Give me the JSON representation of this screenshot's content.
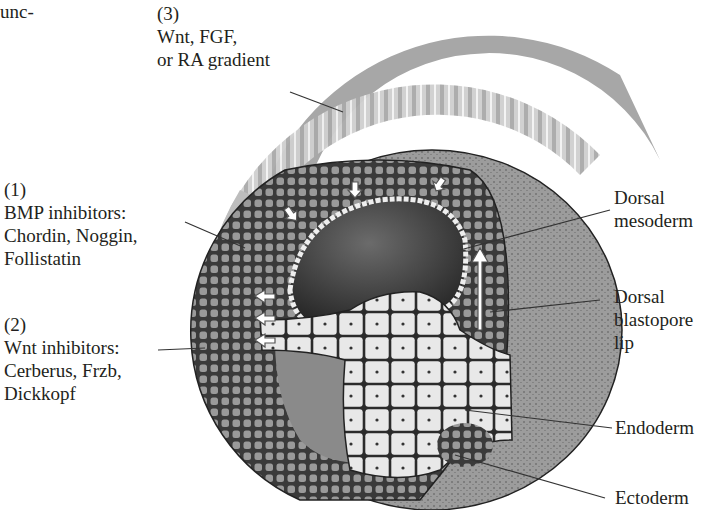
{
  "figure": {
    "partial_text_top_left": "unc-",
    "signals": [
      {
        "number": "(3)",
        "lines": [
          "Wnt, FGF,",
          "or RA gradient"
        ]
      },
      {
        "number": "(1)",
        "lines": [
          "BMP inhibitors:",
          "Chordin, Noggin,",
          "Follistatin"
        ]
      },
      {
        "number": "(2)",
        "lines": [
          "Wnt inhibitors:",
          "Cerberus, Frzb,",
          "Dickkopf"
        ]
      }
    ],
    "structures": [
      {
        "lines": [
          "Dorsal",
          "mesoderm"
        ]
      },
      {
        "lines": [
          "Dorsal",
          "blastopore",
          "lip"
        ]
      },
      {
        "lines": [
          "Endoderm"
        ]
      },
      {
        "lines": [
          "Ectoderm"
        ]
      }
    ],
    "colors": {
      "gradient_band": "#a7a7a7",
      "inhibitor_band_1": "#bdbdbd",
      "inhibitor_band_2": "#dadada",
      "ectoderm_outer": "#8f8f8f",
      "dark_layer": "#3c3c3c",
      "cavity": "#4a4a4a",
      "endoderm_cells": "#e6e6e6",
      "text": "#231f20"
    }
  }
}
